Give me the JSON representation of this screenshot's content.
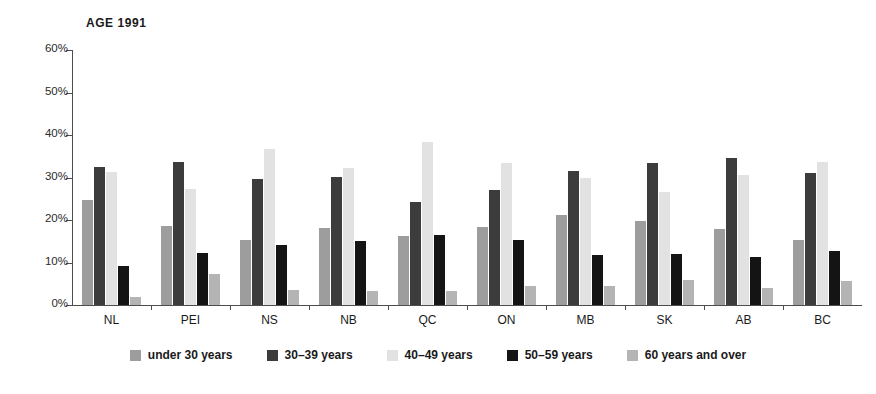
{
  "chart_data": {
    "type": "bar",
    "title": "AGE 1991",
    "xlabel": "",
    "ylabel": "",
    "ylim": [
      0,
      60
    ],
    "ytick_labels": [
      "0%",
      "10%",
      "20%",
      "30%",
      "40%",
      "50%",
      "60%"
    ],
    "ytick_values": [
      0,
      10,
      20,
      30,
      40,
      50,
      60
    ],
    "grid": false,
    "legend_position": "bottom",
    "value_unit": "percent",
    "categories": [
      "NL",
      "PEI",
      "NS",
      "NB",
      "QC",
      "ON",
      "MB",
      "SK",
      "AB",
      "BC"
    ],
    "series": [
      {
        "name": "under 30 years",
        "color": "#9d9d9d",
        "values": [
          24.7,
          18.5,
          15.2,
          18.1,
          16.2,
          18.3,
          21.2,
          19.8,
          17.8,
          15.3
        ]
      },
      {
        "name": "30–39 years",
        "color": "#3c3c3c",
        "values": [
          32.5,
          33.6,
          29.7,
          30.2,
          24.2,
          27.0,
          31.6,
          33.5,
          34.6,
          31.1
        ]
      },
      {
        "name": "40–49 years",
        "color": "#e2e2e2",
        "values": [
          31.2,
          27.3,
          36.7,
          32.2,
          38.3,
          33.5,
          29.8,
          26.6,
          30.7,
          33.7
        ]
      },
      {
        "name": "50–59 years",
        "color": "#141414",
        "values": [
          9.2,
          12.3,
          14.1,
          15.0,
          16.5,
          15.4,
          11.8,
          12.1,
          11.2,
          12.8
        ]
      },
      {
        "name": "60 years and over",
        "color": "#b4b4b4",
        "values": [
          1.8,
          7.2,
          3.5,
          3.3,
          3.2,
          4.4,
          4.5,
          6.0,
          4.1,
          5.6
        ]
      }
    ]
  }
}
